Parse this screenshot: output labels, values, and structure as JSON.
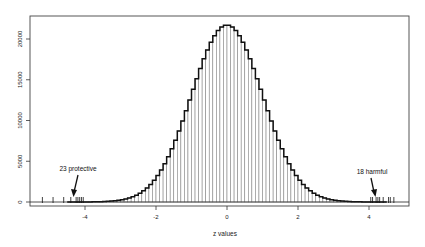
{
  "chart_data": {
    "type": "bar",
    "title": "",
    "xlabel": "z values",
    "ylabel": "",
    "xlim": [
      -5.6,
      5.1
    ],
    "ylim": [
      0,
      22500
    ],
    "x_ticks": [
      -4,
      -2,
      0,
      2,
      4
    ],
    "x_tick_labels": [
      "-4",
      "-2",
      "0",
      "2",
      "4"
    ],
    "y_ticks": [
      0,
      5000,
      10000,
      15000,
      20000
    ],
    "y_tick_labels": [
      "0",
      "5000",
      "10000",
      "15000",
      "20000"
    ],
    "grid": false,
    "legend": null,
    "bin_width": 0.1,
    "bin_range": [
      -4.5,
      4.5
    ],
    "peak_count": 21700,
    "peak_at": 0,
    "distribution_shape": "approximately standard normal (mean 0, sd 1)",
    "overlay_curve": "fitted density (step outline, bold)",
    "rug_left_z": [
      -5.2,
      -4.9,
      -4.6,
      -4.4,
      -4.25,
      -4.2,
      -4.15,
      -4.1,
      -4.05
    ],
    "rug_right_z": [
      4.05,
      4.1,
      4.2,
      4.25,
      4.3,
      4.4,
      4.55,
      4.6,
      4.7
    ],
    "annotations": [
      {
        "text": "23 protective",
        "x": -4.2,
        "arrow_to_y": 0,
        "side": "left"
      },
      {
        "text": "18 harmful",
        "x": 4.1,
        "arrow_to_y": 0,
        "side": "right"
      }
    ]
  },
  "labels": {
    "xlabel": "z values",
    "annot_left": "23 protective",
    "annot_right": "18 harmful"
  }
}
